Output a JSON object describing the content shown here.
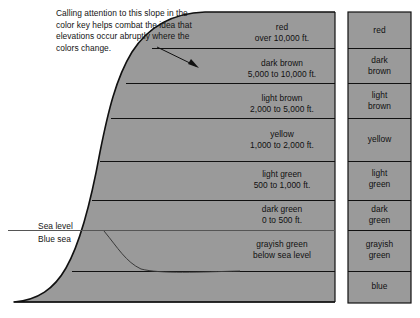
{
  "annotation": {
    "lines": [
      "Calling attention to this slope in the",
      "color key helps combat the idea that",
      "elevations occur abruptly where the",
      "colors change."
    ]
  },
  "axis_labels": {
    "sea_level": "Sea level",
    "blue_sea": "Blue sea"
  },
  "colors": {
    "fill_gray": "#9a9a9a",
    "outline": "#111111",
    "text": "#111111",
    "background": "#ffffff"
  },
  "profile_bands": [
    {
      "color_name": "red",
      "range": "over 10,000 ft.",
      "top": 12,
      "bottom": 48
    },
    {
      "color_name": "dark brown",
      "range": "5,000 to 10,000 ft.",
      "top": 48,
      "bottom": 83
    },
    {
      "color_name": "light brown",
      "range": "2,000 to 5,000 ft.",
      "top": 83,
      "bottom": 118
    },
    {
      "color_name": "yellow",
      "range": "1,000 to 2,000 ft.",
      "top": 118,
      "bottom": 161
    },
    {
      "color_name": "light green",
      "range": "500 to 1,000 ft.",
      "top": 161,
      "bottom": 200
    },
    {
      "color_name": "dark green",
      "range": "0 to 500 ft.",
      "top": 200,
      "bottom": 230
    },
    {
      "color_name": "grayish green",
      "range": "below sea level",
      "top": 230,
      "bottom": 271
    },
    {
      "color_name": "",
      "range": "",
      "top": 271,
      "bottom": 303
    }
  ],
  "color_key": [
    {
      "line1": "red",
      "line2": "",
      "top": 12,
      "bottom": 48
    },
    {
      "line1": "dark",
      "line2": "brown",
      "top": 48,
      "bottom": 83
    },
    {
      "line1": "light",
      "line2": "brown",
      "top": 83,
      "bottom": 118
    },
    {
      "line1": "yellow",
      "line2": "",
      "top": 118,
      "bottom": 161
    },
    {
      "line1": "light",
      "line2": "green",
      "top": 161,
      "bottom": 200
    },
    {
      "line1": "dark",
      "line2": "green",
      "top": 200,
      "bottom": 230
    },
    {
      "line1": "grayish",
      "line2": "green",
      "top": 230,
      "bottom": 271
    },
    {
      "line1": "blue",
      "line2": "",
      "top": 271,
      "bottom": 303
    }
  ]
}
